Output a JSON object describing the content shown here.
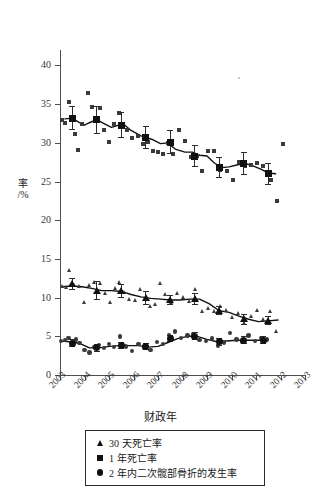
{
  "chart_data": {
    "type": "scatter",
    "title": "",
    "xlabel": "财政年",
    "ylabel": "率 /%",
    "ylim": [
      0,
      42
    ],
    "xlim": [
      2003,
      2013
    ],
    "grid": false,
    "legend_position": "bottom",
    "y_ticks": [
      0,
      5,
      10,
      15,
      20,
      25,
      30,
      35,
      40
    ],
    "x_ticks": [
      "2003",
      "2004",
      "2005",
      "2006",
      "2007",
      "2008",
      "2009",
      "2010",
      "2011",
      "2012",
      "2013"
    ],
    "legend": [
      {
        "key": "triangle",
        "label": "30 天死亡率"
      },
      {
        "key": "square",
        "label": "1 年死亡率"
      },
      {
        "key": "circle",
        "label": "2 年内二次髋部骨折的发生率"
      }
    ],
    "series": [
      {
        "name": "1 年死亡率",
        "marker": "square",
        "annual_x": [
          2003.5,
          2004.5,
          2005.5,
          2006.5,
          2007.5,
          2008.5,
          2009.5,
          2010.5,
          2011.5
        ],
        "annual_y": [
          33.2,
          33.0,
          32.3,
          30.7,
          30.0,
          28.3,
          26.8,
          27.3,
          26.0
        ],
        "annual_err_low": [
          31.6,
          31.2,
          30.6,
          29.2,
          28.6,
          26.9,
          25.4,
          25.8,
          24.6
        ],
        "annual_err_high": [
          34.8,
          34.7,
          34.0,
          32.2,
          31.6,
          29.7,
          28.2,
          28.8,
          27.4
        ],
        "quarterly_x": [
          2003.1,
          2003.2,
          2003.35,
          2003.5,
          2003.6,
          2003.75,
          2003.9,
          2004.15,
          2004.3,
          2004.5,
          2004.65,
          2004.8,
          2005.0,
          2005.2,
          2005.4,
          2005.55,
          2005.75,
          2005.95,
          2006.2,
          2006.4,
          2006.6,
          2006.8,
          2007.0,
          2007.2,
          2007.4,
          2007.6,
          2007.85,
          2008.1,
          2008.35,
          2008.6,
          2008.8,
          2009.05,
          2009.3,
          2009.55,
          2009.8,
          2010.05,
          2010.3,
          2010.55,
          2010.8,
          2011.05,
          2011.3,
          2011.6,
          2011.85,
          2012.1
        ],
        "quarterly_y": [
          33.0,
          32.6,
          35.3,
          33.3,
          31.2,
          29.1,
          32.5,
          36.5,
          34.6,
          33.0,
          34.5,
          31.6,
          30.1,
          32.4,
          33.8,
          32.5,
          31.6,
          30.6,
          30.9,
          29.8,
          30.1,
          29.0,
          28.8,
          28.6,
          30.0,
          28.6,
          31.6,
          30.2,
          28.2,
          28.3,
          26.4,
          28.9,
          28.9,
          26.5,
          26.3,
          25.2,
          27.5,
          27.0,
          27.2,
          27.4,
          27.0,
          25.2,
          22.5,
          29.8
        ]
      },
      {
        "name": "30 天死亡率",
        "marker": "triangle",
        "annual_x": [
          2003.5,
          2004.5,
          2005.5,
          2006.5,
          2007.5,
          2008.5,
          2009.5,
          2010.5,
          2011.5
        ],
        "annual_y": [
          11.8,
          10.9,
          10.8,
          9.9,
          9.7,
          9.8,
          8.3,
          7.2,
          7.0
        ],
        "annual_err_low": [
          11.0,
          9.7,
          9.9,
          9.0,
          9.0,
          9.0,
          7.7,
          6.5,
          6.4
        ],
        "annual_err_high": [
          12.6,
          12.1,
          11.7,
          10.8,
          10.4,
          10.6,
          8.9,
          7.9,
          7.6
        ],
        "quarterly_x": [
          2003.1,
          2003.25,
          2003.4,
          2003.6,
          2003.8,
          2004.0,
          2004.2,
          2004.4,
          2004.65,
          2004.85,
          2005.05,
          2005.25,
          2005.45,
          2005.65,
          2005.85,
          2006.1,
          2006.3,
          2006.5,
          2006.7,
          2006.9,
          2007.1,
          2007.3,
          2007.55,
          2007.8,
          2008.05,
          2008.3,
          2008.55,
          2008.8,
          2009.05,
          2009.3,
          2009.55,
          2009.8,
          2010.05,
          2010.3,
          2010.55,
          2010.8,
          2011.05,
          2011.3,
          2011.6,
          2011.85
        ],
        "quarterly_y": [
          11.4,
          11.3,
          13.5,
          11.5,
          11.4,
          9.3,
          11.6,
          11.9,
          11.8,
          10.5,
          9.4,
          11.2,
          11.9,
          10.6,
          9.8,
          9.6,
          11.1,
          9.8,
          8.8,
          9.1,
          11.8,
          10.4,
          9.4,
          10.5,
          10.0,
          9.5,
          11.0,
          8.2,
          8.6,
          8.2,
          8.9,
          8.3,
          7.4,
          7.9,
          6.7,
          7.5,
          8.3,
          7.1,
          8.2,
          5.6
        ]
      },
      {
        "name": "2 年内二次髋部骨折的发生率",
        "marker": "circle",
        "annual_x": [
          2003.5,
          2004.5,
          2005.5,
          2006.5,
          2007.5,
          2008.5,
          2009.5,
          2010.5,
          2011.3
        ],
        "annual_y": [
          4.1,
          3.5,
          3.8,
          3.7,
          4.7,
          5.0,
          4.3,
          4.5,
          4.5
        ],
        "annual_err_low": [
          3.6,
          3.0,
          3.3,
          3.2,
          4.2,
          4.5,
          3.8,
          4.0,
          4.0
        ],
        "annual_err_high": [
          4.6,
          4.0,
          4.3,
          4.2,
          5.2,
          5.5,
          4.8,
          5.0,
          5.0
        ],
        "quarterly_x": [
          2003.05,
          2003.2,
          2003.35,
          2003.5,
          2003.65,
          2003.8,
          2004.0,
          2004.2,
          2004.4,
          2004.6,
          2004.8,
          2005.0,
          2005.2,
          2005.45,
          2005.7,
          2005.95,
          2006.2,
          2006.45,
          2006.7,
          2006.95,
          2007.2,
          2007.45,
          2007.7,
          2007.95,
          2008.2,
          2008.45,
          2008.7,
          2008.95,
          2009.2,
          2009.45,
          2009.7,
          2009.95,
          2010.2,
          2010.45,
          2010.7,
          2010.95,
          2011.2,
          2011.45
        ],
        "quarterly_y": [
          4.4,
          4.5,
          4.8,
          4.3,
          4.6,
          4.1,
          3.2,
          2.9,
          3.6,
          3.9,
          3.5,
          4.0,
          3.6,
          5.0,
          3.7,
          3.1,
          4.0,
          3.5,
          3.2,
          4.3,
          4.0,
          5.2,
          5.6,
          4.8,
          5.1,
          5.3,
          4.5,
          4.4,
          4.7,
          3.8,
          4.2,
          5.4,
          4.6,
          4.3,
          5.1,
          4.4,
          4.8,
          4.6
        ]
      }
    ],
    "trend_lines": [
      {
        "name": "1 年死亡率 趋势线",
        "x": [
          2003.2,
          2003.5,
          2003.8,
          2004.0,
          2004.2,
          2004.5,
          2004.8,
          2005.1,
          2005.4,
          2005.6,
          2005.9,
          2006.3,
          2006.5,
          2006.8,
          2007.1,
          2007.4,
          2007.7,
          2008.1,
          2008.4,
          2008.7,
          2009.0,
          2009.3,
          2009.6,
          2009.9,
          2010.3,
          2010.6,
          2010.9,
          2011.2,
          2011.5,
          2011.8
        ],
        "y": [
          33.1,
          33.2,
          32.6,
          32.3,
          32.6,
          33.0,
          32.5,
          32.0,
          32.3,
          32.4,
          31.6,
          30.9,
          30.7,
          30.4,
          29.9,
          30.0,
          29.2,
          28.8,
          28.8,
          28.4,
          28.3,
          27.4,
          26.8,
          26.9,
          27.2,
          27.3,
          27.0,
          26.6,
          26.1,
          26.0
        ]
      },
      {
        "name": "30 天死亡率 趋势线",
        "x": [
          2003.1,
          2003.5,
          2003.9,
          2004.3,
          2004.7,
          2005.1,
          2005.5,
          2005.9,
          2006.3,
          2006.7,
          2007.1,
          2007.5,
          2007.9,
          2008.3,
          2008.7,
          2009.1,
          2009.5,
          2009.9,
          2010.3,
          2010.7,
          2011.1,
          2011.5,
          2011.9
        ],
        "y": [
          11.4,
          11.5,
          11.4,
          11.2,
          10.9,
          10.9,
          10.8,
          10.4,
          10.1,
          9.9,
          9.8,
          9.7,
          9.7,
          9.8,
          9.8,
          9.2,
          8.3,
          8.1,
          7.6,
          7.2,
          6.9,
          7.0,
          7.1
        ]
      },
      {
        "name": "2 年内二次髋部骨折 趋势线",
        "x": [
          2003.05,
          2003.4,
          2003.8,
          2004.2,
          2004.6,
          2005.0,
          2005.4,
          2005.8,
          2006.2,
          2006.6,
          2007.0,
          2007.4,
          2007.8,
          2008.2,
          2008.6,
          2009.0,
          2009.4,
          2009.8,
          2010.2,
          2010.6,
          2011.0,
          2011.45
        ],
        "y": [
          4.4,
          4.3,
          4.1,
          3.5,
          3.5,
          3.7,
          3.8,
          3.8,
          3.8,
          3.6,
          3.7,
          4.2,
          4.7,
          5.0,
          5.0,
          4.6,
          4.3,
          4.4,
          4.5,
          4.5,
          4.5,
          4.5
        ]
      }
    ]
  }
}
